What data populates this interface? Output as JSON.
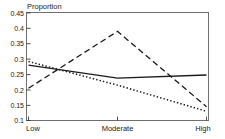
{
  "chart_data": {
    "type": "line",
    "title": "",
    "ylabel": "Proportion",
    "xlabel": "",
    "categories": [
      "Low",
      "Moderate",
      "High"
    ],
    "x": [
      0,
      1,
      2
    ],
    "ylim": [
      0.1,
      0.45
    ],
    "xlim": [
      0,
      2
    ],
    "y_ticks": [
      0.1,
      0.15,
      0.2,
      0.25,
      0.3,
      0.35,
      0.4,
      0.45
    ],
    "y_tick_labels": [
      "0.1",
      "0.15",
      "0.2",
      "0.25",
      "0.3",
      "0.35",
      "0.4",
      "0.45"
    ],
    "x_tick_labels": [
      "Low",
      "Moderate",
      "High"
    ],
    "grid": false,
    "legend": "none",
    "series": [
      {
        "name": "solid",
        "style": "solid",
        "color": "#1a1a1a",
        "values": [
          0.28,
          0.238,
          0.248
        ]
      },
      {
        "name": "dashed",
        "style": "dashed",
        "color": "#1a1a1a",
        "values": [
          0.205,
          0.39,
          0.145
        ]
      },
      {
        "name": "dotted",
        "style": "dotted",
        "color": "#1a1a1a",
        "values": [
          0.292,
          0.215,
          0.13
        ]
      }
    ]
  },
  "axis": {
    "y_title": "Proportion",
    "tick_0": "0.45",
    "tick_1": "0.4",
    "tick_2": "0.35",
    "tick_3": "0.3",
    "tick_4": "0.25",
    "tick_5": "0.2",
    "tick_6": "0.15",
    "tick_7": "0.1",
    "x_low": "Low",
    "x_moderate": "Moderate",
    "x_high": "High"
  },
  "colors": {
    "ink": "#1a1a1a",
    "frame": "#6e6e6e",
    "background": "#ffffff"
  }
}
